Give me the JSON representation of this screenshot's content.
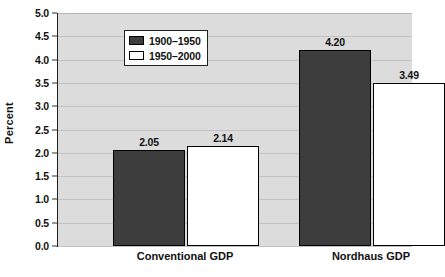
{
  "chart_data": {
    "type": "bar",
    "title": "",
    "xlabel": "",
    "ylabel": "Percent",
    "categories": [
      "Conventional GDP",
      "Nordhaus GDP"
    ],
    "series": [
      {
        "name": "1900–1950",
        "values": [
          2.05,
          3.49
        ],
        "color": "#3d3d3d"
      },
      {
        "name": "1950–2000",
        "values": [
          2.14,
          3.49
        ],
        "color": "#ffffff"
      }
    ],
    "ylim": [
      0.0,
      5.0
    ],
    "ytick_step": 0.5,
    "yticks": [
      "5.0",
      "4.5",
      "4.0",
      "3.5",
      "3.0",
      "2.5",
      "2.0",
      "1.5",
      "1.0",
      "0.5",
      "0.0"
    ],
    "grid": true,
    "legend_position": "upper-left-inside",
    "bars": [
      {
        "category": "Conventional GDP",
        "series": "1900–1950",
        "value": 2.05,
        "label": "2.05",
        "fill": "#3d3d3d"
      },
      {
        "category": "Conventional GDP",
        "series": "1950–2000",
        "value": 2.14,
        "label": "2.14",
        "fill": "#ffffff"
      },
      {
        "category": "Nordhaus GDP",
        "series": "1900–1950",
        "value": 4.2,
        "label": "4.20",
        "fill": "#3d3d3d"
      },
      {
        "category": "Nordhaus GDP",
        "series": "1950–2000",
        "value": 3.49,
        "label": "3.49",
        "fill": "#ffffff"
      }
    ],
    "colors": {
      "plot_background": "#dcdcdc",
      "gridline": "#c2c2c2",
      "axis": "#222222",
      "text": "#111111",
      "series_1900_1950": "#3d3d3d",
      "series_1950_2000": "#ffffff"
    }
  }
}
